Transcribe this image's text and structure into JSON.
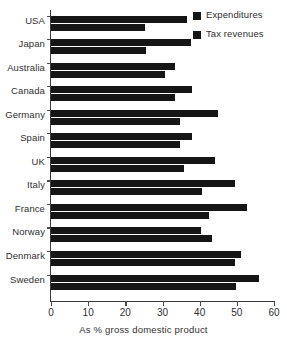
{
  "chart_data": {
    "type": "bar",
    "orientation": "horizontal",
    "title": "",
    "xlabel": "As % gross domestic product",
    "ylabel": "",
    "xlim": [
      0,
      60
    ],
    "xticks": [
      0,
      10,
      20,
      30,
      40,
      50,
      60
    ],
    "xtick_labels": [
      "0",
      "10",
      "20",
      "30",
      "40",
      "50",
      "60"
    ],
    "grid": false,
    "legend_position": "top-right",
    "categories": [
      "USA",
      "Japan",
      "Australia",
      "Canada",
      "Germany",
      "Spain",
      "UK",
      "Italy",
      "France",
      "Norway",
      "Denmark",
      "Sweden"
    ],
    "series": [
      {
        "name": "Expenditures",
        "color": "#161616",
        "values": [
          36.6,
          37.7,
          33.4,
          38.0,
          45.0,
          38.0,
          44.2,
          49.5,
          52.7,
          40.4,
          51.1,
          56.0
        ]
      },
      {
        "name": "Tax revenues",
        "color": "#161616",
        "values": [
          25.3,
          25.6,
          30.7,
          33.4,
          34.7,
          34.7,
          35.8,
          40.6,
          42.5,
          43.4,
          49.5,
          49.8
        ]
      }
    ]
  },
  "legend": {
    "items": [
      {
        "label": "Expenditures",
        "swatch": "legend-swatch-expenditures"
      },
      {
        "label": "Tax revenues",
        "swatch": "legend-swatch-tax-revenues"
      }
    ]
  }
}
